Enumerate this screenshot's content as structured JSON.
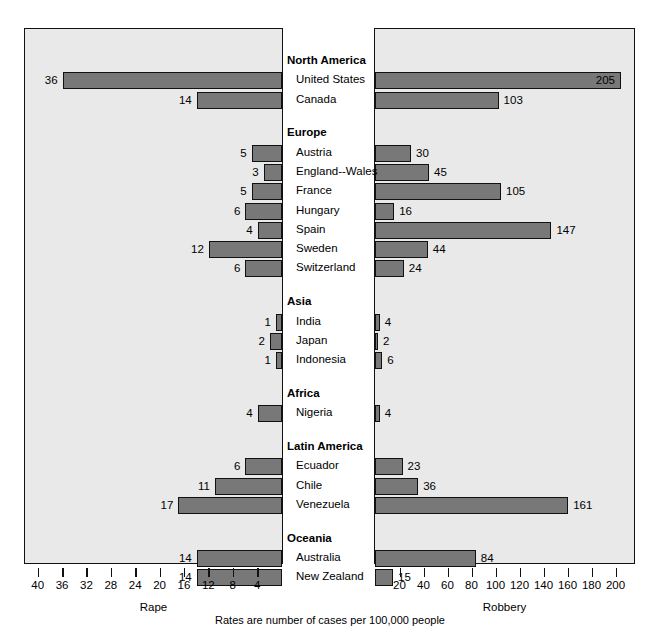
{
  "chart_data": {
    "type": "bar",
    "title": "",
    "footnote": "Rates are number of cases per 100,000 people",
    "orientation": "horizontal",
    "layout": "paired back-to-back panels with centered category labels",
    "panels": [
      {
        "name": "rape",
        "side": "left",
        "xlabel": "Rape",
        "direction": "right-to-left",
        "xlim": [
          0,
          42
        ],
        "ticks": [
          40,
          36,
          32,
          28,
          24,
          20,
          16,
          12,
          8,
          4
        ],
        "tick_labels": [
          "40",
          "36",
          "32",
          "28",
          "24",
          "20",
          "16",
          "12",
          "8",
          "4"
        ],
        "grid": false
      },
      {
        "name": "robbery",
        "side": "right",
        "xlabel": "Robbery",
        "direction": "left-to-right",
        "xlim": [
          0,
          215
        ],
        "ticks": [
          20,
          40,
          60,
          80,
          100,
          120,
          140,
          160,
          180,
          200
        ],
        "tick_labels": [
          "20",
          "40",
          "60",
          "80",
          "100",
          "120",
          "140",
          "160",
          "180",
          "200"
        ],
        "grid": false
      }
    ],
    "rows": [
      {
        "kind": "group",
        "label": "North America"
      },
      {
        "kind": "item",
        "label": "United States",
        "rape": 36,
        "robbery": 205
      },
      {
        "kind": "item",
        "label": "Canada",
        "rape": 14,
        "robbery": 103
      },
      {
        "kind": "spacer"
      },
      {
        "kind": "group",
        "label": "Europe"
      },
      {
        "kind": "item",
        "label": "Austria",
        "rape": 5,
        "robbery": 30
      },
      {
        "kind": "item",
        "label": "England--Wales",
        "rape": 3,
        "robbery": 45
      },
      {
        "kind": "item",
        "label": "France",
        "rape": 5,
        "robbery": 105
      },
      {
        "kind": "item",
        "label": "Hungary",
        "rape": 6,
        "robbery": 16
      },
      {
        "kind": "item",
        "label": "Spain",
        "rape": 4,
        "robbery": 147
      },
      {
        "kind": "item",
        "label": "Sweden",
        "rape": 12,
        "robbery": 44
      },
      {
        "kind": "item",
        "label": "Switzerland",
        "rape": 6,
        "robbery": 24
      },
      {
        "kind": "spacer"
      },
      {
        "kind": "group",
        "label": "Asia"
      },
      {
        "kind": "item",
        "label": "India",
        "rape": 1,
        "robbery": 4
      },
      {
        "kind": "item",
        "label": "Japan",
        "rape": 2,
        "robbery": 2
      },
      {
        "kind": "item",
        "label": "Indonesia",
        "rape": 1,
        "robbery": 6
      },
      {
        "kind": "spacer"
      },
      {
        "kind": "group",
        "label": "Africa"
      },
      {
        "kind": "item",
        "label": "Nigeria",
        "rape": 4,
        "robbery": 4
      },
      {
        "kind": "spacer"
      },
      {
        "kind": "group",
        "label": "Latin America"
      },
      {
        "kind": "item",
        "label": "Ecuador",
        "rape": 6,
        "robbery": 23
      },
      {
        "kind": "item",
        "label": "Chile",
        "rape": 11,
        "robbery": 36
      },
      {
        "kind": "item",
        "label": "Venezuela",
        "rape": 17,
        "robbery": 161
      },
      {
        "kind": "spacer"
      },
      {
        "kind": "group",
        "label": "Oceania"
      },
      {
        "kind": "item",
        "label": "Australia",
        "rape": 14,
        "robbery": 84
      },
      {
        "kind": "item",
        "label": "New Zealand",
        "rape": 14,
        "robbery": 15
      }
    ],
    "colors": {
      "bar_fill": "#787878",
      "bar_stroke": "#111111",
      "panel_background": "#e9e9e9",
      "panel_border": "#111111",
      "text": "#000000",
      "page_background": "#ffffff"
    }
  }
}
